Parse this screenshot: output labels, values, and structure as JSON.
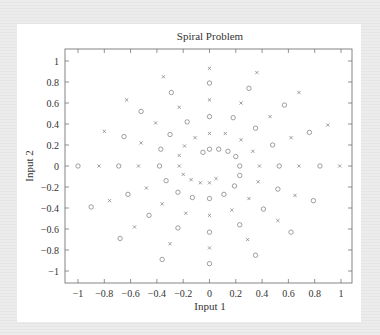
{
  "chart_data": {
    "type": "scatter",
    "title": "Spiral Problem",
    "xlabel": "Input 1",
    "ylabel": "Input 2",
    "xlim": [
      -1.1,
      1.1
    ],
    "ylim": [
      -1.1,
      1.1
    ],
    "xticks": [
      -1,
      -0.8,
      -0.6,
      -0.4,
      -0.2,
      0,
      0.2,
      0.4,
      0.6,
      0.8,
      1
    ],
    "yticks": [
      -1,
      -0.8,
      -0.6,
      -0.4,
      -0.2,
      0,
      0.2,
      0.4,
      0.6,
      0.8,
      1
    ],
    "xtick_labels": [
      "−1",
      "−0.8",
      "−0.6",
      "−0.4",
      "−0.2",
      "0",
      "0.2",
      "0.4",
      "0.6",
      "0.8",
      "1"
    ],
    "ytick_labels": [
      "−1",
      "−0.8",
      "−0.6",
      "−0.4",
      "−0.2",
      "0",
      "0.2",
      "0.4",
      "0.6",
      "0.8",
      "1"
    ],
    "grid": false,
    "legend": null,
    "series": [
      {
        "name": "Spiral 1",
        "marker": "circle",
        "color": "#777777",
        "points": [
          [
            -0.05,
            0.13
          ],
          [
            0,
            0.16
          ],
          [
            0.07,
            0.16
          ],
          [
            0.14,
            0.14
          ],
          [
            0.2,
            0.09
          ],
          [
            0.23,
            0
          ],
          [
            0.23,
            -0.09
          ],
          [
            0.19,
            -0.19
          ],
          [
            0.11,
            -0.27
          ],
          [
            0,
            -0.31
          ],
          [
            -0.13,
            -0.3
          ],
          [
            -0.24,
            -0.25
          ],
          [
            -0.33,
            -0.14
          ],
          [
            -0.38,
            0
          ],
          [
            -0.37,
            0.16
          ],
          [
            -0.3,
            0.3
          ],
          [
            -0.17,
            0.42
          ],
          [
            0,
            0.47
          ],
          [
            0.18,
            0.46
          ],
          [
            0.35,
            0.36
          ],
          [
            0.48,
            0.2
          ],
          [
            0.53,
            0
          ],
          [
            0.52,
            -0.22
          ],
          [
            0.41,
            -0.41
          ],
          [
            0.23,
            -0.56
          ],
          [
            0,
            -0.63
          ],
          [
            -0.24,
            -0.59
          ],
          [
            -0.46,
            -0.47
          ],
          [
            -0.62,
            -0.27
          ],
          [
            -0.69,
            0
          ],
          [
            -0.65,
            0.28
          ],
          [
            -0.52,
            0.52
          ],
          [
            -0.29,
            0.7
          ],
          [
            0,
            0.79
          ],
          [
            0.3,
            0.74
          ],
          [
            0.57,
            0.58
          ],
          [
            0.76,
            0.32
          ],
          [
            0.84,
            0
          ],
          [
            0.79,
            -0.33
          ],
          [
            0.62,
            -0.63
          ],
          [
            0.35,
            -0.85
          ],
          [
            0,
            -0.93
          ],
          [
            -0.36,
            -0.89
          ],
          [
            -0.68,
            -0.69
          ],
          [
            -0.9,
            -0.39
          ],
          [
            -1.0,
            0
          ]
        ]
      },
      {
        "name": "Spiral 2",
        "marker": "cross",
        "color": "#777777",
        "points": [
          [
            0.05,
            -0.12
          ],
          [
            0,
            -0.16
          ],
          [
            -0.07,
            -0.16
          ],
          [
            -0.14,
            -0.13
          ],
          [
            -0.2,
            -0.08
          ],
          [
            -0.23,
            0
          ],
          [
            -0.23,
            0.1
          ],
          [
            -0.19,
            0.19
          ],
          [
            -0.11,
            0.27
          ],
          [
            0,
            0.31
          ],
          [
            0.12,
            0.31
          ],
          [
            0.24,
            0.25
          ],
          [
            0.33,
            0.14
          ],
          [
            0.38,
            0
          ],
          [
            0.37,
            -0.15
          ],
          [
            0.3,
            -0.31
          ],
          [
            0.17,
            -0.42
          ],
          [
            0,
            -0.47
          ],
          [
            -0.18,
            -0.45
          ],
          [
            -0.36,
            -0.36
          ],
          [
            -0.48,
            -0.21
          ],
          [
            -0.54,
            0
          ],
          [
            -0.52,
            0.22
          ],
          [
            -0.41,
            0.41
          ],
          [
            -0.23,
            0.56
          ],
          [
            0,
            0.63
          ],
          [
            0.24,
            0.6
          ],
          [
            0.46,
            0.47
          ],
          [
            0.62,
            0.27
          ],
          [
            0.68,
            0
          ],
          [
            0.65,
            -0.28
          ],
          [
            0.52,
            -0.52
          ],
          [
            0.29,
            -0.7
          ],
          [
            0,
            -0.78
          ],
          [
            -0.3,
            -0.74
          ],
          [
            -0.57,
            -0.58
          ],
          [
            -0.76,
            -0.33
          ],
          [
            -0.84,
            0
          ],
          [
            -0.8,
            0.33
          ],
          [
            -0.63,
            0.63
          ],
          [
            -0.35,
            0.85
          ],
          [
            0,
            0.93
          ],
          [
            0.36,
            0.89
          ],
          [
            0.68,
            0.7
          ],
          [
            0.9,
            0.39
          ],
          [
            0.99,
            0
          ]
        ]
      }
    ]
  },
  "colors": {
    "background": "#e8e8e8",
    "card": "#ffffff",
    "axis": "#555555",
    "text": "#333333",
    "marker": "#777777"
  }
}
